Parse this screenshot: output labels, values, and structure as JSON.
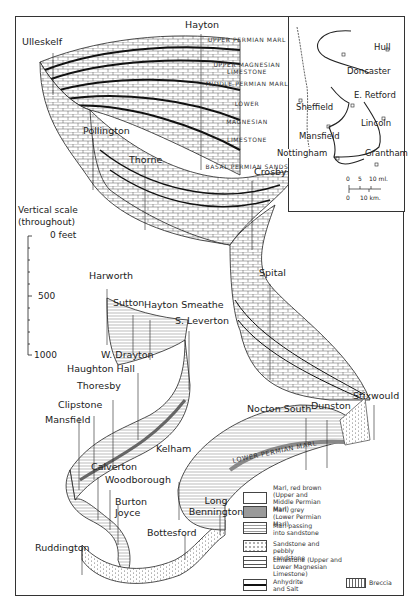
{
  "diagram": {
    "title": "",
    "type": "fence-diagram",
    "stratigraphy_labels": [
      "UPPER PERMIAN MARL",
      "UPPER MAGNESIAN LIMESTONE",
      "MIDDLE PERMIAN MARL",
      "LOWER",
      "MAGNESIAN",
      "LIMESTONE",
      "BASAL PERMIAN SANDS"
    ],
    "in_section_label": "LOWER PERMIAN MARL",
    "boreholes": [
      "Hayton",
      "Ulleskelf",
      "Pollington",
      "Thorne",
      "Crosby",
      "Harworth",
      "Sutton",
      "Hayton Smeathe",
      "S. Leverton",
      "Spital",
      "W. Drayton",
      "Haughton Hall",
      "Thoresby",
      "Clipstone",
      "Mansfield",
      "Calverton",
      "Woodborough",
      "Burton Joyce",
      "Ruddington",
      "Kelham",
      "Long Bennington",
      "Bottesford",
      "Nocton South",
      "Dunston",
      "Stixwould"
    ],
    "vertical_scale": {
      "title_line1": "Vertical scale",
      "title_line2": "(throughout)",
      "ticks": [
        "0 feet",
        "500",
        "1000"
      ]
    }
  },
  "inset_map": {
    "places": [
      "Hull",
      "Doncaster",
      "Sheffield",
      "E. Retford",
      "Lincoln",
      "Mansfield",
      "Nottingham",
      "Grantham"
    ],
    "scale": {
      "miles_ticks": [
        "0",
        "5",
        "10 ml."
      ],
      "km_ticks": [
        "0",
        "10 km."
      ]
    }
  },
  "legend": {
    "items": [
      {
        "label": "Marl, red brown (Upper and Middle Permian Marl)",
        "pattern": "blank"
      },
      {
        "label": "Marl, grey (Lower Permian Marl)",
        "pattern": "grey"
      },
      {
        "label": "Marl passing into sandstone",
        "pattern": "dotted-lines"
      },
      {
        "label": "Sandstone and pebbly sandstone",
        "pattern": "dots"
      },
      {
        "label": "Limestone (Upper and Lower Magnesian Limestone)",
        "pattern": "brick"
      },
      {
        "label": "Anhydrite and Salt",
        "pattern": "black-line"
      },
      {
        "label": "Breccia",
        "pattern": "breccia"
      }
    ]
  },
  "colors": {
    "ink": "#222222",
    "grey_marl": "#9a9a9a",
    "paper": "#ffffff"
  }
}
